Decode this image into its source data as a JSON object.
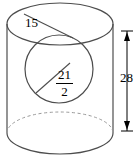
{
  "figure": {
    "stroke_color": "#4d4d4d",
    "dashed_color": "#9a9a9a",
    "text_color": "#000000",
    "background": "#ffffff",
    "labels": {
      "top_radius": "15",
      "height": "28",
      "sphere_radius_numerator": "21",
      "sphere_radius_denominator": "2"
    },
    "shapes": {
      "cylinder_top_ellipse": "top-ellipse",
      "cylinder_bottom_ellipse": "bottom-ellipse",
      "cylinder_hidden_ellipse": "hidden-dashed-ellipse",
      "cylinder_left_wall": "left-side-line",
      "cylinder_right_wall": "right-side-line",
      "inscribed_sphere": "sphere-circle",
      "top_radius_line": "radius-segment-top",
      "sphere_radius_line": "radius-segment-sphere",
      "height_dimension": "vertical-dimension-line"
    }
  }
}
